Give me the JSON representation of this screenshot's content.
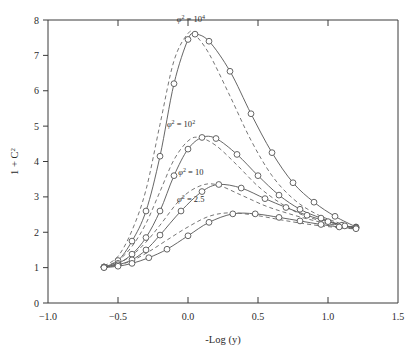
{
  "chart_data": {
    "type": "line",
    "title": "",
    "xlabel": "-Log (y)",
    "ylabel": "1 + C2",
    "xlim": [
      -1.0,
      1.5
    ],
    "ylim": [
      0,
      8
    ],
    "grid": false,
    "legend_position": "inline-annotations",
    "xticks": [
      "-1.0",
      "-0.5",
      "0.0",
      "0.5",
      "1.0",
      "1.5"
    ],
    "xtick_values": [
      -1.0,
      -0.5,
      0.0,
      0.5,
      1.0,
      1.5
    ],
    "yticks": [
      "0",
      "1",
      "2",
      "3",
      "4",
      "5",
      "6",
      "7",
      "8"
    ],
    "ytick_values": [
      0,
      1,
      2,
      3,
      4,
      5,
      6,
      7,
      8
    ],
    "annotations": [
      {
        "text": "φ² = 10⁴",
        "base": "φ",
        "exp": "2",
        "rhs": "10",
        "rhs_exp": "4",
        "x": 0.02,
        "y": 7.95
      },
      {
        "text": "φ² = 10²",
        "base": "φ",
        "exp": "2",
        "rhs": "10",
        "rhs_exp": "2",
        "x": -0.05,
        "y": 4.98
      },
      {
        "text": "φ² = 10",
        "base": "φ",
        "exp": "2",
        "rhs": "10",
        "rhs_exp": "",
        "x": 0.02,
        "y": 3.62
      },
      {
        "text": "φ² = 2.5",
        "base": "φ",
        "exp": "2",
        "rhs": "2.5",
        "rhs_exp": "",
        "x": 0.02,
        "y": 2.85
      }
    ],
    "series": [
      {
        "name": "φ² = 10⁴",
        "style": "solid",
        "markers": true,
        "x": [
          -0.6,
          -0.5,
          -0.4,
          -0.3,
          -0.2,
          -0.1,
          0.0,
          0.05,
          0.15,
          0.3,
          0.45,
          0.6,
          0.75,
          0.9,
          1.05,
          1.2
        ],
        "y": [
          1.02,
          1.2,
          1.75,
          2.6,
          4.15,
          6.2,
          7.45,
          7.6,
          7.4,
          6.55,
          5.35,
          4.25,
          3.4,
          2.85,
          2.45,
          2.15
        ]
      },
      {
        "name": "φ² = 10⁴ (model)",
        "style": "dashed",
        "markers": false,
        "x": [
          -0.6,
          -0.5,
          -0.4,
          -0.3,
          -0.2,
          -0.1,
          0.0,
          0.05,
          0.15,
          0.3,
          0.45,
          0.6,
          0.75,
          0.9,
          1.05,
          1.2
        ],
        "y": [
          1.05,
          1.32,
          2.05,
          3.2,
          5.05,
          6.85,
          7.62,
          7.58,
          7.05,
          5.85,
          4.6,
          3.6,
          2.95,
          2.55,
          2.3,
          2.12
        ]
      },
      {
        "name": "φ² = 10²",
        "style": "solid",
        "markers": true,
        "x": [
          -0.6,
          -0.5,
          -0.4,
          -0.3,
          -0.2,
          -0.1,
          0.0,
          0.1,
          0.2,
          0.35,
          0.5,
          0.65,
          0.8,
          0.95,
          1.1,
          1.2
        ],
        "y": [
          1.02,
          1.12,
          1.38,
          1.85,
          2.6,
          3.6,
          4.35,
          4.68,
          4.65,
          4.2,
          3.6,
          3.05,
          2.65,
          2.4,
          2.2,
          2.14
        ]
      },
      {
        "name": "φ² = 10² (model)",
        "style": "dashed",
        "markers": false,
        "x": [
          -0.6,
          -0.5,
          -0.4,
          -0.3,
          -0.2,
          -0.1,
          0.0,
          0.08,
          0.2,
          0.35,
          0.5,
          0.65,
          0.8,
          0.95,
          1.1,
          1.2
        ],
        "y": [
          1.04,
          1.2,
          1.6,
          2.25,
          3.15,
          4.05,
          4.58,
          4.68,
          4.45,
          3.9,
          3.3,
          2.85,
          2.52,
          2.32,
          2.18,
          2.12
        ]
      },
      {
        "name": "φ² = 10",
        "style": "solid",
        "markers": true,
        "x": [
          -0.6,
          -0.5,
          -0.4,
          -0.3,
          -0.2,
          -0.05,
          0.1,
          0.22,
          0.38,
          0.55,
          0.7,
          0.85,
          1.0,
          1.12,
          1.2
        ],
        "y": [
          1.01,
          1.08,
          1.22,
          1.5,
          1.92,
          2.6,
          3.15,
          3.35,
          3.25,
          2.95,
          2.7,
          2.48,
          2.3,
          2.18,
          2.12
        ]
      },
      {
        "name": "φ² = 10 (model)",
        "style": "dashed",
        "markers": false,
        "x": [
          -0.6,
          -0.5,
          -0.4,
          -0.3,
          -0.2,
          -0.05,
          0.08,
          0.2,
          0.38,
          0.55,
          0.7,
          0.85,
          1.0,
          1.12,
          1.2
        ],
        "y": [
          1.02,
          1.12,
          1.35,
          1.72,
          2.2,
          2.95,
          3.3,
          3.35,
          3.05,
          2.75,
          2.55,
          2.38,
          2.24,
          2.16,
          2.12
        ]
      },
      {
        "name": "φ² = 2.5",
        "style": "solid",
        "markers": true,
        "x": [
          -0.6,
          -0.5,
          -0.4,
          -0.28,
          -0.15,
          0.0,
          0.15,
          0.32,
          0.48,
          0.65,
          0.8,
          0.95,
          1.08,
          1.2
        ],
        "y": [
          1.0,
          1.04,
          1.12,
          1.28,
          1.52,
          1.9,
          2.28,
          2.52,
          2.52,
          2.42,
          2.32,
          2.22,
          2.15,
          2.1
        ]
      },
      {
        "name": "φ² = 2.5 (model)",
        "style": "dashed",
        "markers": false,
        "x": [
          -0.6,
          -0.5,
          -0.4,
          -0.28,
          -0.15,
          0.0,
          0.15,
          0.3,
          0.48,
          0.65,
          0.8,
          0.95,
          1.08,
          1.2
        ],
        "y": [
          1.01,
          1.07,
          1.2,
          1.45,
          1.78,
          2.15,
          2.45,
          2.55,
          2.48,
          2.36,
          2.26,
          2.18,
          2.13,
          2.09
        ]
      }
    ]
  },
  "figure": {
    "background": "#ffffff",
    "line_color": "#555555",
    "axis_color": "#3a3a3a"
  }
}
